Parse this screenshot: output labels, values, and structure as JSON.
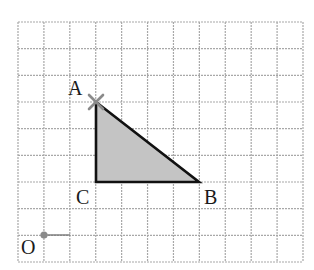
{
  "diagram": {
    "type": "grid-figure",
    "grid": {
      "columns": 11,
      "rows": 9,
      "line_color": "#a8a8a8"
    },
    "points": {
      "A": {
        "label": "A",
        "grid": [
          3,
          3
        ],
        "marker": "cross"
      },
      "B": {
        "label": "B",
        "grid": [
          7,
          6
        ]
      },
      "C": {
        "label": "C",
        "grid": [
          3,
          6
        ]
      },
      "O": {
        "label": "O",
        "grid": [
          1,
          8
        ],
        "marker": "dot"
      }
    },
    "triangle": {
      "vertices": [
        "A",
        "B",
        "C"
      ],
      "fill": "#c4c4c4",
      "stroke": "#111111"
    },
    "colors": {
      "marker": "#8a8a8a"
    }
  }
}
